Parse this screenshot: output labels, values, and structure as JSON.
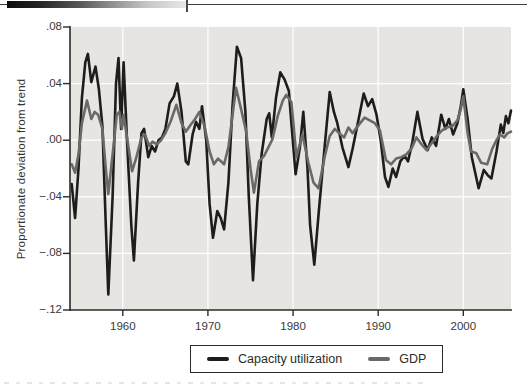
{
  "chart_data": {
    "type": "line",
    "title": "",
    "xlabel": "",
    "ylabel": "Proportionate deviation from trend",
    "xlim": [
      1953.8,
      2005.6
    ],
    "ylim": [
      -0.12,
      0.08
    ],
    "grid": true,
    "plot_bg": "#e7e5e2",
    "grid_color": "#ffffff",
    "axis_color": "#2a2a2a",
    "x_ticks": [
      1960,
      1970,
      1980,
      1990,
      2000
    ],
    "x_tick_labels": [
      "1960",
      "1970",
      "1980",
      "1990",
      "2000"
    ],
    "y_ticks": [
      0.08,
      0.04,
      0.0,
      -0.04,
      -0.08,
      -0.12
    ],
    "y_tick_labels": [
      ".08",
      ".04",
      ".00",
      "−.04",
      "−.08",
      "−.12"
    ],
    "legend_position": "bottom-center-box",
    "series": [
      {
        "name": "Capacity utilization",
        "color": "#1e1d1b",
        "width": 2.6,
        "x": [
          1954.0,
          1954.4,
          1954.8,
          1955.2,
          1955.6,
          1955.9,
          1956.3,
          1956.8,
          1957.2,
          1957.6,
          1958.0,
          1958.3,
          1958.8,
          1959.2,
          1959.5,
          1959.8,
          1960.1,
          1960.5,
          1961.0,
          1961.3,
          1961.8,
          1962.2,
          1962.5,
          1963.0,
          1963.4,
          1963.8,
          1964.2,
          1964.6,
          1965.0,
          1965.5,
          1966.0,
          1966.4,
          1966.9,
          1967.4,
          1967.7,
          1968.2,
          1968.6,
          1969.0,
          1969.3,
          1969.8,
          1970.2,
          1970.6,
          1971.1,
          1971.5,
          1971.9,
          1972.4,
          1972.9,
          1973.4,
          1973.9,
          1974.4,
          1974.8,
          1975.3,
          1975.8,
          1976.3,
          1976.9,
          1977.2,
          1977.5,
          1978.0,
          1978.5,
          1979.0,
          1979.5,
          1979.9,
          1980.3,
          1980.8,
          1981.2,
          1981.7,
          1982.0,
          1982.5,
          1983.0,
          1983.6,
          1984.3,
          1984.8,
          1985.2,
          1985.8,
          1986.5,
          1987.0,
          1987.6,
          1988.3,
          1988.8,
          1989.3,
          1989.8,
          1990.3,
          1990.8,
          1991.2,
          1991.7,
          1992.1,
          1992.6,
          1993.1,
          1993.5,
          1994.0,
          1994.6,
          1995.2,
          1995.8,
          1996.3,
          1996.8,
          1997.4,
          1997.9,
          1998.3,
          1998.8,
          1999.3,
          1999.7,
          2000.0,
          2000.5,
          2001.0,
          2001.8,
          2002.4,
          2002.9,
          2003.3,
          2003.9,
          2004.4,
          2004.7,
          2005.0,
          2005.3,
          2005.6
        ],
        "y": [
          -0.031,
          -0.055,
          -0.02,
          0.03,
          0.055,
          0.061,
          0.041,
          0.052,
          0.036,
          0.01,
          -0.06,
          -0.109,
          -0.04,
          0.04,
          0.058,
          0.008,
          0.055,
          0.0,
          -0.06,
          -0.085,
          -0.03,
          0.005,
          0.008,
          -0.012,
          -0.004,
          -0.008,
          0.0,
          0.002,
          0.008,
          0.026,
          0.031,
          0.04,
          0.02,
          -0.015,
          -0.017,
          0.004,
          0.013,
          0.008,
          0.024,
          0.0,
          -0.045,
          -0.069,
          -0.05,
          -0.055,
          -0.063,
          -0.03,
          0.025,
          0.066,
          0.058,
          0.02,
          -0.04,
          -0.099,
          -0.045,
          -0.01,
          0.015,
          0.019,
          0.002,
          0.03,
          0.048,
          0.043,
          0.035,
          0.005,
          -0.024,
          -0.005,
          0.02,
          -0.02,
          -0.06,
          -0.088,
          -0.052,
          -0.012,
          0.034,
          0.02,
          0.012,
          -0.005,
          -0.019,
          -0.006,
          0.012,
          0.033,
          0.024,
          0.029,
          0.018,
          0.0,
          -0.026,
          -0.033,
          -0.02,
          -0.026,
          -0.015,
          -0.011,
          -0.015,
          -0.002,
          0.02,
          0.001,
          -0.007,
          0.002,
          -0.004,
          0.018,
          0.008,
          0.015,
          0.004,
          0.012,
          0.024,
          0.036,
          0.015,
          -0.012,
          -0.034,
          -0.021,
          -0.025,
          -0.027,
          -0.008,
          0.011,
          0.005,
          0.017,
          0.012,
          0.021
        ]
      },
      {
        "name": "GDP",
        "color": "#6b6966",
        "width": 2.6,
        "x": [
          1954.0,
          1954.4,
          1954.8,
          1955.2,
          1955.8,
          1956.3,
          1956.7,
          1957.1,
          1957.6,
          1958.0,
          1958.3,
          1958.8,
          1959.3,
          1959.6,
          1959.9,
          1960.1,
          1960.5,
          1961.1,
          1961.6,
          1962.2,
          1962.6,
          1963.1,
          1963.5,
          1964.0,
          1964.5,
          1965.0,
          1965.6,
          1966.3,
          1966.9,
          1967.4,
          1968.0,
          1968.5,
          1969.0,
          1969.6,
          1970.2,
          1970.7,
          1971.2,
          1971.9,
          1972.4,
          1972.9,
          1973.3,
          1973.9,
          1974.5,
          1975.0,
          1975.4,
          1976.0,
          1976.6,
          1977.1,
          1977.6,
          1978.2,
          1978.8,
          1979.2,
          1979.8,
          1980.4,
          1981.1,
          1981.8,
          1982.4,
          1983.0,
          1983.7,
          1984.3,
          1984.9,
          1985.4,
          1986.0,
          1986.5,
          1987.0,
          1987.6,
          1988.4,
          1989.0,
          1989.6,
          1990.2,
          1990.9,
          1991.5,
          1992.1,
          1992.7,
          1993.3,
          1993.9,
          1994.5,
          1995.1,
          1995.7,
          1996.3,
          1996.9,
          1997.5,
          1998.1,
          1998.7,
          1999.3,
          1999.7,
          2000.0,
          2000.5,
          2000.9,
          2001.5,
          2002.1,
          2002.8,
          2003.4,
          2003.9,
          2004.3,
          2004.8,
          2005.2,
          2005.6
        ],
        "y": [
          -0.017,
          -0.023,
          -0.01,
          0.012,
          0.028,
          0.015,
          0.02,
          0.018,
          0.008,
          -0.02,
          -0.038,
          -0.01,
          0.018,
          0.02,
          0.008,
          0.018,
          0.002,
          -0.022,
          -0.012,
          0.002,
          0.004,
          -0.004,
          -0.001,
          -0.003,
          0.0,
          0.005,
          0.013,
          0.025,
          0.012,
          0.006,
          0.011,
          0.015,
          0.02,
          0.01,
          -0.008,
          -0.017,
          -0.013,
          -0.017,
          -0.005,
          0.018,
          0.037,
          0.022,
          0.006,
          -0.02,
          -0.037,
          -0.015,
          -0.011,
          -0.005,
          0.001,
          0.017,
          0.028,
          0.032,
          0.027,
          -0.012,
          0.004,
          -0.016,
          -0.03,
          -0.034,
          -0.012,
          0.003,
          0.008,
          0.005,
          0.002,
          0.009,
          0.005,
          0.01,
          0.016,
          0.014,
          0.012,
          0.007,
          -0.014,
          -0.017,
          -0.013,
          -0.012,
          -0.01,
          -0.006,
          0.002,
          -0.003,
          -0.007,
          -0.002,
          0.003,
          0.007,
          0.009,
          0.01,
          0.014,
          0.022,
          0.031,
          0.005,
          -0.008,
          -0.009,
          -0.016,
          -0.017,
          -0.006,
          0.0,
          0.004,
          0.002,
          0.005,
          0.006
        ]
      }
    ]
  },
  "legend": {
    "entries": [
      {
        "label": "Capacity utilization",
        "color": "#1e1d1b"
      },
      {
        "label": "GDP",
        "color": "#6b6966"
      }
    ]
  }
}
